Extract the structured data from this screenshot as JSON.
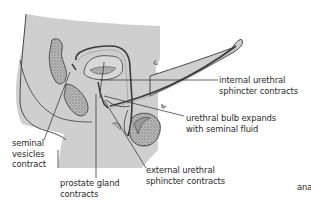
{
  "figure": {
    "type": "anatomical-diagram",
    "colors": {
      "tissue_fill": "#cfcfcf",
      "outline": "#3a3a3a",
      "stipple": "#7a7a7a",
      "background": "#ffffff",
      "text": "#2a2a2a"
    },
    "labels": [
      {
        "id": "internal-urethral-sphincter",
        "lines": [
          "internal urethral",
          "sphincter contracts"
        ]
      },
      {
        "id": "urethral-bulb",
        "lines": [
          "urethral bulb expands",
          "with seminal fluid"
        ]
      },
      {
        "id": "seminal-vesicles",
        "lines": [
          "seminal",
          "vesicles",
          "contract"
        ]
      },
      {
        "id": "external-urethral-sphincter",
        "lines": [
          "external urethral",
          "sphincter contracts"
        ]
      },
      {
        "id": "prostate-gland",
        "lines": [
          "prostate gland",
          "contracts"
        ]
      }
    ],
    "cutoff_text": "ana"
  }
}
